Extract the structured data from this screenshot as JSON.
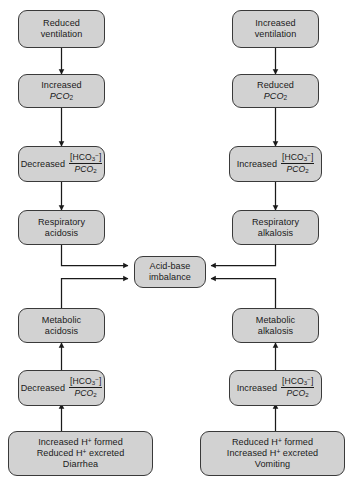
{
  "diagram": {
    "type": "flowchart",
    "palette": {
      "node_fill": "#d2d2d2",
      "node_border": "#3a3a3a",
      "edge": "#1a1a1a",
      "background": "#ffffff",
      "text": "#1a1a1a"
    },
    "nodes": {
      "reduced_ventilation": {
        "line1": "Reduced",
        "line2": "ventilation"
      },
      "increased_ventilation": {
        "line1": "Increased",
        "line2": "ventilation"
      },
      "increased_pco2": {
        "line1": "Increased",
        "line2_prefix": "P",
        "line2_body": "CO",
        "line2_sub": "2"
      },
      "reduced_pco2": {
        "line1": "Reduced",
        "line2_prefix": "P",
        "line2_body": "CO",
        "line2_sub": "2"
      },
      "decreased_ratio_top": {
        "label": "Decreased",
        "numerator_open": "[HCO",
        "numerator_sub": "3",
        "numerator_sup": "−",
        "numerator_close": "]",
        "denominator_prefix": "P",
        "denominator_body": "CO",
        "denominator_sub": "2"
      },
      "increased_ratio_top": {
        "label": "Increased",
        "numerator_open": "[HCO",
        "numerator_sub": "3",
        "numerator_sup": "−",
        "numerator_close": "]",
        "denominator_prefix": "P",
        "denominator_body": "CO",
        "denominator_sub": "2"
      },
      "respiratory_acidosis": {
        "line1": "Respiratory",
        "line2": "acidosis"
      },
      "respiratory_alkalosis": {
        "line1": "Respiratory",
        "line2": "alkalosis"
      },
      "acid_base_imbalance": {
        "line1": "Acid-base",
        "line2": "imbalance"
      },
      "metabolic_acidosis": {
        "line1": "Metabolic",
        "line2": "acidosis"
      },
      "metabolic_alkalosis": {
        "line1": "Metabolic",
        "line2": "alkalosis"
      },
      "decreased_ratio_bottom": {
        "label": "Decreased",
        "numerator_open": "[HCO",
        "numerator_sub": "3",
        "numerator_sup": "−",
        "numerator_close": "]",
        "denominator_prefix": "P",
        "denominator_body": "CO",
        "denominator_sub": "2"
      },
      "increased_ratio_bottom": {
        "label": "Increased",
        "numerator_open": "[HCO",
        "numerator_sub": "3",
        "numerator_sup": "−",
        "numerator_close": "]",
        "denominator_prefix": "P",
        "denominator_body": "CO",
        "denominator_sub": "2"
      },
      "metabolic_acidosis_causes": {
        "line1_a": "Increased H",
        "line1_sup": "+",
        "line1_b": " formed",
        "line2_a": "Reduced H",
        "line2_sup": "+",
        "line2_b": " excreted",
        "line3": "Diarrhea"
      },
      "metabolic_alkalosis_causes": {
        "line1_a": "Reduced H",
        "line1_sup": "+",
        "line1_b": " formed",
        "line2_a": "Increased H",
        "line2_sup": "+",
        "line2_b": " excreted",
        "line3": "Vomiting"
      }
    },
    "edges": [
      {
        "from": "reduced_ventilation",
        "to": "increased_pco2",
        "direction": "down"
      },
      {
        "from": "increased_pco2",
        "to": "decreased_ratio_top",
        "direction": "down"
      },
      {
        "from": "decreased_ratio_top",
        "to": "respiratory_acidosis",
        "direction": "down"
      },
      {
        "from": "respiratory_acidosis",
        "to": "acid_base_imbalance",
        "direction": "elbow-right"
      },
      {
        "from": "increased_ventilation",
        "to": "reduced_pco2",
        "direction": "down"
      },
      {
        "from": "reduced_pco2",
        "to": "increased_ratio_top",
        "direction": "down"
      },
      {
        "from": "increased_ratio_top",
        "to": "respiratory_alkalosis",
        "direction": "down"
      },
      {
        "from": "respiratory_alkalosis",
        "to": "acid_base_imbalance",
        "direction": "elbow-left"
      },
      {
        "from": "metabolic_acidosis",
        "to": "acid_base_imbalance",
        "direction": "elbow-right"
      },
      {
        "from": "decreased_ratio_bottom",
        "to": "metabolic_acidosis",
        "direction": "up"
      },
      {
        "from": "metabolic_acidosis_causes",
        "to": "decreased_ratio_bottom",
        "direction": "up"
      },
      {
        "from": "metabolic_alkalosis",
        "to": "acid_base_imbalance",
        "direction": "elbow-left"
      },
      {
        "from": "increased_ratio_bottom",
        "to": "metabolic_alkalosis",
        "direction": "up"
      },
      {
        "from": "metabolic_alkalosis_causes",
        "to": "increased_ratio_bottom",
        "direction": "up"
      }
    ]
  }
}
